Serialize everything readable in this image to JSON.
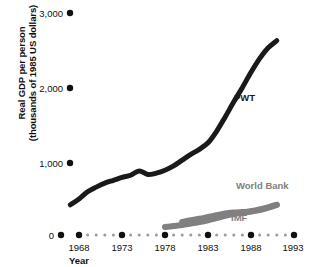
{
  "chart_data": {
    "type": "line",
    "title": "",
    "xlabel": "Year",
    "ylabel": "Real GDP per person (thousands of 1985 US dollars)",
    "ylabel_line1": "Real GDP per person",
    "ylabel_line2": "(thousands of 1985 US dollars)",
    "grid": false,
    "legend_position": "inline-annotations",
    "xlim": [
      1966,
      1994
    ],
    "ylim": [
      0,
      3000
    ],
    "x_tick_labels": [
      "1968",
      "1973",
      "1978",
      "1983",
      "1988",
      "1993"
    ],
    "x_tick_values": [
      1968,
      1973,
      1978,
      1983,
      1988,
      1993
    ],
    "x_minor_ticks_between_majors": 4,
    "y_tick_labels": [
      "0",
      "1,000",
      "2,000",
      "3,000"
    ],
    "y_tick_values": [
      0,
      1000,
      2000,
      3000
    ],
    "axis_style": "dotted-marker-axis",
    "series": [
      {
        "name": "PWT",
        "label": "PWT",
        "color": "#1a1a1a",
        "line_width": 5,
        "x": [
          1967,
          1968,
          1969,
          1970,
          1971,
          1972,
          1973,
          1974,
          1975,
          1976,
          1977,
          1978,
          1979,
          1980,
          1981,
          1982,
          1983,
          1984,
          1985,
          1986,
          1987,
          1988,
          1989,
          1990,
          1991
        ],
        "values": [
          420,
          500,
          600,
          665,
          720,
          760,
          800,
          830,
          890,
          840,
          860,
          900,
          960,
          1040,
          1120,
          1190,
          1280,
          1440,
          1640,
          1850,
          2050,
          2260,
          2450,
          2600,
          2700
        ]
      },
      {
        "name": "World Bank",
        "label": "World Bank",
        "color": "#808080",
        "line_width": 6,
        "x": [
          1980,
          1981,
          1982,
          1983,
          1984,
          1985,
          1986,
          1987,
          1988,
          1989,
          1990,
          1991
        ],
        "values": [
          180,
          205,
          225,
          250,
          275,
          300,
          312,
          318,
          325,
          345,
          380,
          420
        ]
      },
      {
        "name": "IMF",
        "label": "IMF",
        "color": "#808080",
        "line_width": 6,
        "x": [
          1978,
          1979,
          1980,
          1981,
          1982,
          1983,
          1984,
          1985,
          1986,
          1987,
          1988,
          1989,
          1990,
          1991
        ],
        "values": [
          110,
          125,
          140,
          160,
          180,
          205,
          235,
          265,
          290,
          310,
          330,
          355,
          385,
          420
        ]
      }
    ],
    "annotations": [
      {
        "text": "PWT",
        "x": 1988,
        "y": 2050,
        "color": "#1a1a1a"
      },
      {
        "text": "World Bank",
        "x": 1988.5,
        "y": 580,
        "color": "#808080"
      },
      {
        "text": "IMF",
        "x": 1987,
        "y": 175,
        "color": "#808080"
      }
    ]
  }
}
